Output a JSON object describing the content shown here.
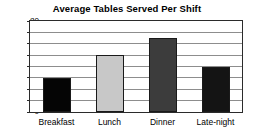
{
  "chart_data": {
    "type": "bar",
    "title": "Average Tables Served Per Shift",
    "xlabel": "",
    "ylabel": "",
    "categories": [
      "Breakfast",
      "Lunch",
      "Dinner",
      "Late-night"
    ],
    "values": [
      30,
      50,
      65,
      40
    ],
    "bar_colors": [
      "#050505",
      "#c8c8c8",
      "#3c3c3c",
      "#141414"
    ],
    "ylim": [
      0,
      80
    ],
    "ytick_labels": [
      "0",
      "10",
      "20",
      "30",
      "40",
      "50",
      "60",
      "70",
      "80"
    ],
    "ytick_values": [
      0,
      10,
      20,
      30,
      40,
      50,
      60,
      70,
      80
    ],
    "grid": "horizontal",
    "legend": "none",
    "frame_color": "#2b2b2b",
    "gridline_color": "#8d8d8d",
    "background": "#ffffff"
  }
}
